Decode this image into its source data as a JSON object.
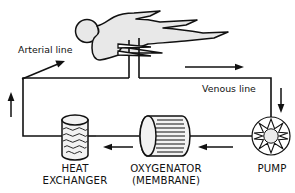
{
  "diagram": {
    "labels": {
      "arterial_line": "Arterial line",
      "venous_line": "Venous line",
      "heat_exchanger_line1": "HEAT",
      "heat_exchanger_line2": "EXCHANGER",
      "oxygenator_line1": "OXYGENATOR",
      "oxygenator_line2": "(MEMBRANE)",
      "pump": "PUMP"
    },
    "components": [
      {
        "id": "patient",
        "name": "patient-figure",
        "shape": "supine-human-silhouette"
      },
      {
        "id": "heat-exchanger",
        "name": "heat-exchanger",
        "shape": "vertical-cylinder-wavy"
      },
      {
        "id": "oxygenator",
        "name": "oxygenator",
        "shape": "horizontal-cylinder-fibers"
      },
      {
        "id": "pump",
        "name": "pump",
        "shape": "circle-star-rotor"
      }
    ],
    "flow_arrows": [
      {
        "id": "arrow-arterial-to-patient",
        "direction": "up-right"
      },
      {
        "id": "arrow-venous-right",
        "direction": "right"
      },
      {
        "id": "arrow-down-to-pump",
        "direction": "down"
      },
      {
        "id": "arrow-pump-to-oxygenator",
        "direction": "left"
      },
      {
        "id": "arrow-oxygenator-to-heat-exchanger",
        "direction": "left"
      },
      {
        "id": "arrow-heat-exchanger-up",
        "direction": "up"
      }
    ],
    "colors": {
      "stroke": "#111111",
      "body_fill": "#e8e8e8",
      "component_face": "#f2f2f2",
      "background": "#ffffff"
    }
  }
}
